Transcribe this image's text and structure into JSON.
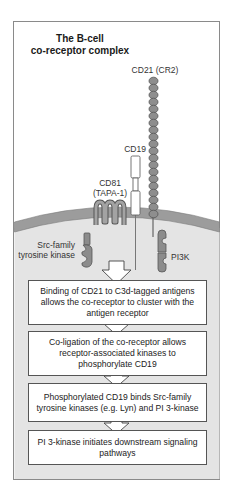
{
  "title": {
    "line1": "The B-cell",
    "line2": "co-receptor complex"
  },
  "labels": {
    "cd21": "CD21 (CR2)",
    "cd19": "CD19",
    "cd81_line1": "CD81",
    "cd81_line2": "(TAPA-1)",
    "src_line1": "Src-family",
    "src_line2": "tyrosine kinase",
    "pi3k": "PI3K"
  },
  "steps": [
    {
      "text": "Binding of CD21 to C3d-tagged antigens allows the co-receptor to cluster with the antigen receptor"
    },
    {
      "text": "Co-ligation of the co-receptor allows receptor-associated kinases to phosphorylate CD19"
    },
    {
      "text": "Phosphorylated CD19 binds Src-family tyrosine kinases (e.g. Lyn) and PI 3-kinase"
    },
    {
      "text": "PI 3-kinase initiates downstream signaling pathways"
    }
  ],
  "colors": {
    "frame_border": "#8a8a8a",
    "membrane": "#9a9a9a",
    "cytoplasm": "#e6e6e6",
    "protein_fill": "#8c8c8c",
    "protein_stroke": "#555555"
  }
}
